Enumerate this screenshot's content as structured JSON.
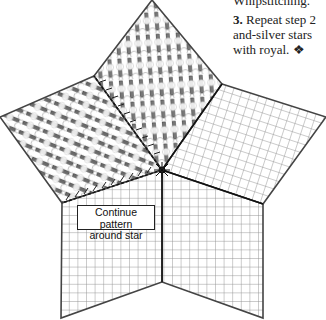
{
  "instructions": {
    "line0": "Whipstitching.",
    "step_number": "3.",
    "line1_rest": " Repeat step 2",
    "line2": "and-silver stars",
    "line3": "with royal. ❖"
  },
  "diagram": {
    "label_line1": "Continue pattern",
    "label_line2": "around star",
    "colors": {
      "outline": "#444444",
      "grid": "#9a9a9a",
      "stitch_dark": "#5a5a5a",
      "stitch_mid": "#8c8c8c",
      "stitch_light": "#bdbdbd",
      "background": "#ffffff"
    },
    "points": {
      "center": [
        162,
        170
      ],
      "top": [
        152,
        0
      ],
      "inner_top_right": [
        222,
        84
      ],
      "right": [
        326,
        117
      ],
      "inner_bottom_right": [
        263,
        204
      ],
      "bottom_right": [
        263,
        318
      ],
      "inner_bottom": [
        162,
        282
      ],
      "bottom_left": [
        61,
        318
      ],
      "inner_left": [
        62,
        203
      ],
      "left": [
        0,
        117
      ],
      "inner_top_left": [
        94,
        76
      ]
    }
  }
}
